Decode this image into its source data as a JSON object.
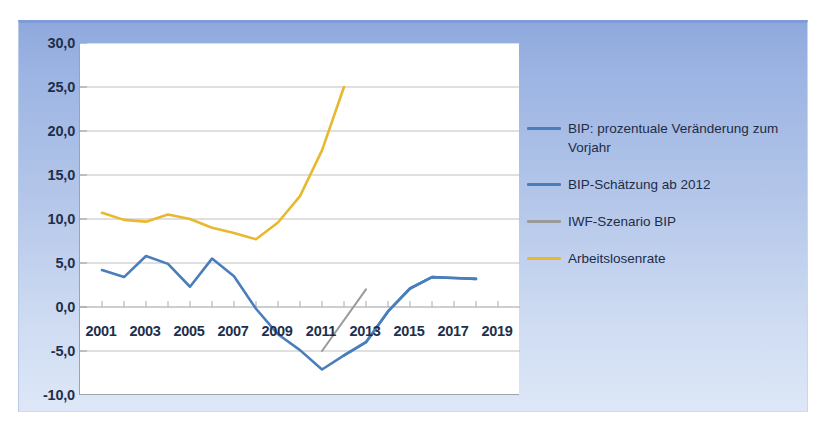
{
  "chart_data": {
    "type": "line",
    "title": "",
    "subtitle": "",
    "xlabel": "",
    "ylabel": "",
    "xlim": [
      2000,
      2020
    ],
    "ylim": [
      -10,
      30
    ],
    "ytick_step": 5,
    "xtick_step": 2,
    "grid": true,
    "grid_axis": "y",
    "legend_position": "right",
    "x_tick_labels": [
      "2001",
      "2003",
      "2005",
      "2007",
      "2009",
      "2011",
      "2013",
      "2015",
      "2017",
      "2019"
    ],
    "x_tick_values": [
      2001,
      2003,
      2005,
      2007,
      2009,
      2011,
      2013,
      2015,
      2017,
      2019
    ],
    "y_tick_labels": [
      "30,0",
      "25,0",
      "20,0",
      "15,0",
      "10,0",
      "5,0",
      "0,0",
      "-5,0",
      "-10,0"
    ],
    "y_tick_values": [
      30,
      25,
      20,
      15,
      10,
      5,
      0,
      -5,
      -10
    ],
    "minor_x_ticks": true,
    "series": [
      {
        "name": "BIP: prozentuale Veränderung zum Vorjahr",
        "color": "#4a7ebb",
        "style": "solid",
        "x": [
          2001,
          2002,
          2003,
          2004,
          2005,
          2006,
          2007,
          2008,
          2009,
          2010,
          2011,
          2012,
          2013,
          2014,
          2015,
          2016,
          2017,
          2018
        ],
        "values": [
          4.2,
          3.4,
          5.8,
          4.9,
          2.3,
          5.5,
          3.5,
          -0.2,
          -3.1,
          -4.9,
          -7.1,
          -5.5,
          -4.0,
          -0.5,
          2.1,
          3.4,
          3.3,
          3.2
        ]
      },
      {
        "name": "BIP-Schätzung ab 2012",
        "color": "#4a7ebb",
        "style": "solid",
        "x": [
          2012,
          2013,
          2014,
          2015,
          2016,
          2017,
          2018
        ],
        "values": [
          -5.5,
          -4.0,
          -0.5,
          2.1,
          3.4,
          3.3,
          3.2
        ]
      },
      {
        "name": "IWF-Szenario BIP",
        "color": "#9a9a9a",
        "style": "solid",
        "x": [
          2011,
          2013
        ],
        "values": [
          -5.0,
          2.0
        ]
      },
      {
        "name": "Arbeitslosenrate",
        "color": "#e8b82e",
        "style": "solid",
        "x": [
          2001,
          2002,
          2003,
          2004,
          2005,
          2006,
          2007,
          2008,
          2009,
          2010,
          2011,
          2012
        ],
        "values": [
          10.7,
          9.9,
          9.7,
          10.5,
          10.0,
          9.0,
          8.4,
          7.7,
          9.6,
          12.6,
          17.8,
          25.0
        ]
      }
    ]
  },
  "axes": {
    "y_labels": [
      "30,0",
      "25,0",
      "20,0",
      "15,0",
      "10,0",
      "5,0",
      "0,0",
      "-5,0",
      "-10,0"
    ],
    "x_labels": [
      "2001",
      "2003",
      "2005",
      "2007",
      "2009",
      "2011",
      "2013",
      "2015",
      "2017",
      "2019"
    ]
  },
  "legend": {
    "items": [
      {
        "label": "BIP: prozentuale Veränderung zum Vorjahr",
        "color": "#4a7ebb"
      },
      {
        "label": "BIP-Schätzung ab 2012",
        "color": "#4a7ebb"
      },
      {
        "label": "IWF-Szenario BIP",
        "color": "#9a9a9a"
      },
      {
        "label": "Arbeitslosenrate",
        "color": "#e8b82e"
      }
    ]
  },
  "caption": {
    "text": ""
  },
  "colors": {
    "panel_top": "#8fa9dd",
    "panel_bottom": "#dde7f7",
    "plot_background": "#ffffff",
    "gridline": "#b9b9b9",
    "axis": "#9aa3ae",
    "text": "#1f2f4a",
    "gdp_blue": "#4a7ebb",
    "imf_gray": "#9a9a9a",
    "unemployment_yellow": "#e8b82e"
  }
}
